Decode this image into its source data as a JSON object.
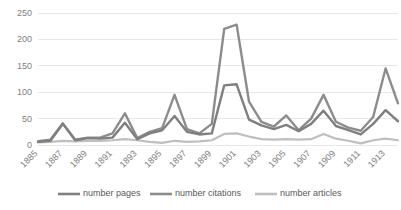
{
  "chart_data": {
    "type": "line",
    "title": "",
    "xlabel": "",
    "ylabel": "",
    "ylim": [
      0,
      250
    ],
    "yticks": [
      0,
      50,
      100,
      150,
      200,
      250
    ],
    "grid": true,
    "legend_position": "bottom",
    "x": [
      1885,
      1886,
      1887,
      1888,
      1889,
      1890,
      1891,
      1892,
      1893,
      1894,
      1895,
      1896,
      1897,
      1898,
      1899,
      1900,
      1901,
      1902,
      1903,
      1904,
      1905,
      1906,
      1907,
      1908,
      1909,
      1910,
      1911,
      1912,
      1913,
      1914
    ],
    "xtick_labels": [
      "1885",
      "1887",
      "1889",
      "1891",
      "1893",
      "1895",
      "1897",
      "1899",
      "1901",
      "1903",
      "1905",
      "1907",
      "1909",
      "1911",
      "1913"
    ],
    "series": [
      {
        "name": "number pages",
        "color": "#7f7f7f",
        "values": [
          6,
          8,
          40,
          9,
          13,
          12,
          14,
          42,
          11,
          22,
          28,
          55,
          25,
          20,
          22,
          113,
          115,
          48,
          37,
          30,
          38,
          26,
          40,
          65,
          36,
          28,
          20,
          40,
          66,
          45
        ]
      },
      {
        "name": "number citations",
        "color": "#8c8c8c",
        "values": [
          7,
          10,
          41,
          10,
          14,
          14,
          22,
          60,
          13,
          25,
          32,
          95,
          30,
          22,
          40,
          220,
          228,
          82,
          44,
          35,
          56,
          28,
          50,
          95,
          44,
          33,
          27,
          53,
          145,
          79
        ]
      },
      {
        "name": "number articles",
        "color": "#bfbfbf",
        "values": [
          5,
          6,
          8,
          7,
          8,
          8,
          9,
          11,
          9,
          6,
          4,
          8,
          6,
          7,
          9,
          21,
          22,
          16,
          11,
          10,
          11,
          10,
          11,
          21,
          12,
          8,
          3,
          9,
          12,
          9
        ]
      }
    ]
  },
  "legend": {
    "items": [
      {
        "label": "number pages",
        "color": "#7f7f7f"
      },
      {
        "label": "number citations",
        "color": "#8c8c8c"
      },
      {
        "label": "number articles",
        "color": "#bfbfbf"
      }
    ]
  }
}
